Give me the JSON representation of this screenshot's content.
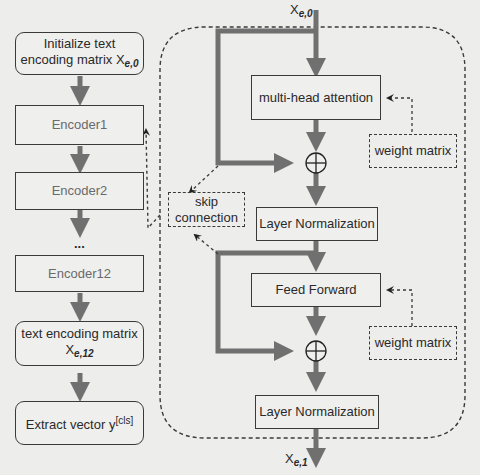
{
  "left_column": {
    "init_box": {
      "line1": "Initialize text",
      "line2": "encoding matrix X",
      "sub": "e,0"
    },
    "encoder1": "Encoder1",
    "encoder2": "Encoder2",
    "ellipsis": "...",
    "encoder12": "Encoder12",
    "output_box": {
      "line1": "text encoding matrix",
      "line2": "X",
      "sub": "e,12"
    },
    "extract_box": {
      "text": "Extract vector y",
      "sup": "[cls]"
    }
  },
  "encoder_detail": {
    "input_label": {
      "text": "X",
      "sub": "e,0"
    },
    "multi_head_attention": "multi-head attention",
    "layer_norm_1": "Layer Normalization",
    "feed_forward": "Feed Forward",
    "layer_norm_2": "Layer Normalization",
    "output_label": {
      "text": "X",
      "sub": "e,1"
    },
    "weight_matrix_1": "weight matrix",
    "weight_matrix_2": "weight matrix",
    "skip_connection": {
      "line1": "skip",
      "line2": "connection"
    },
    "add_symbol": "⊕"
  },
  "colors": {
    "arrow": "#707070",
    "border": "#3a3a3a",
    "background": "#ededeb"
  }
}
